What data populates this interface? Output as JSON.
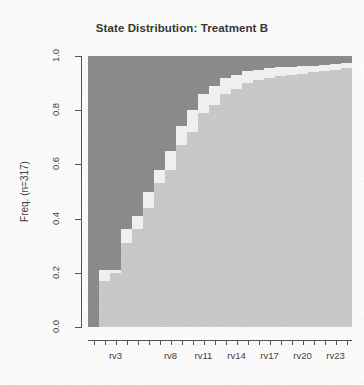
{
  "chart_data": {
    "type": "area",
    "title": "State Distribution: Treatment B",
    "xlabel": "",
    "ylabel": "Freq. (n=317)",
    "ylim": [
      0.0,
      1.0
    ],
    "xlim": [
      0.5,
      24.5
    ],
    "grid": false,
    "legend_position": "none",
    "stacked": true,
    "normalized": true,
    "categories": [
      "rv1",
      "rv2",
      "rv3",
      "rv4",
      "rv5",
      "rv6",
      "rv7",
      "rv8",
      "rv9",
      "rv10",
      "rv11",
      "rv12",
      "rv13",
      "rv14",
      "rv15",
      "rv16",
      "rv17",
      "rv18",
      "rv19",
      "rv20",
      "rv21",
      "rv22",
      "rv23",
      "rv24"
    ],
    "x_tick_labels": [
      "rv3",
      "rv8",
      "rv11",
      "rv14",
      "rv17",
      "rv20",
      "rv23"
    ],
    "x_tick_indices": [
      3,
      8,
      11,
      14,
      17,
      20,
      23
    ],
    "y_tick_labels": [
      "0.0",
      "0.2",
      "0.4",
      "0.6",
      "0.8",
      "1.0"
    ],
    "y_tick_values": [
      0.0,
      0.2,
      0.4,
      0.6,
      0.8,
      1.0
    ],
    "series": [
      {
        "name": "state-light",
        "color": "#c9c9c9",
        "values": [
          0.0,
          0.17,
          0.2,
          0.31,
          0.36,
          0.44,
          0.53,
          0.58,
          0.67,
          0.72,
          0.79,
          0.82,
          0.86,
          0.88,
          0.9,
          0.91,
          0.92,
          0.925,
          0.93,
          0.935,
          0.94,
          0.945,
          0.95,
          0.955
        ]
      },
      {
        "name": "state-white",
        "color": "#f4f4f4",
        "values": [
          0.0,
          0.04,
          0.01,
          0.05,
          0.05,
          0.06,
          0.05,
          0.07,
          0.07,
          0.08,
          0.07,
          0.07,
          0.06,
          0.05,
          0.045,
          0.04,
          0.035,
          0.033,
          0.03,
          0.028,
          0.025,
          0.023,
          0.02,
          0.018
        ]
      },
      {
        "name": "state-dark",
        "color": "#868686",
        "values": [
          1.0,
          0.79,
          0.79,
          0.64,
          0.59,
          0.5,
          0.42,
          0.35,
          0.26,
          0.2,
          0.14,
          0.11,
          0.08,
          0.07,
          0.055,
          0.05,
          0.045,
          0.042,
          0.04,
          0.037,
          0.035,
          0.032,
          0.03,
          0.027
        ]
      }
    ]
  },
  "plot": {
    "left_px": 88,
    "top_px": 56,
    "width_px": 264,
    "height_px": 271
  }
}
